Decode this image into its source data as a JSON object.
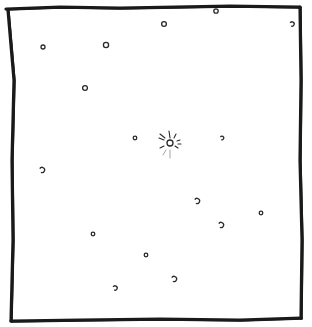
{
  "image": {
    "description": "Hand-drawn square frame containing scattered small circles with a central circle surrounded by radiating marks",
    "colors": {
      "background": "#ffffff",
      "ink": "#1a1a1a"
    }
  },
  "frame": {
    "top": [
      [
        6,
        9
      ],
      [
        60,
        7
      ],
      [
        120,
        8
      ],
      [
        175,
        7
      ],
      [
        230,
        6
      ],
      [
        300,
        7
      ]
    ],
    "right": [
      [
        300,
        7
      ],
      [
        301,
        80
      ],
      [
        300,
        160
      ],
      [
        302,
        240
      ],
      [
        301,
        318
      ]
    ],
    "bottom": [
      [
        301,
        318
      ],
      [
        240,
        320
      ],
      [
        160,
        319
      ],
      [
        80,
        320
      ],
      [
        11,
        321
      ]
    ],
    "left": [
      [
        11,
        321
      ],
      [
        13,
        240
      ],
      [
        12,
        160
      ],
      [
        14,
        80
      ],
      [
        8,
        10
      ]
    ]
  },
  "dots": [
    {
      "x": 43,
      "y": 47,
      "r": 2.0
    },
    {
      "x": 106,
      "y": 45,
      "r": 2.6
    },
    {
      "x": 164,
      "y": 24,
      "r": 2.4
    },
    {
      "x": 216,
      "y": 11,
      "r": 2.2
    },
    {
      "x": 292,
      "y": 24,
      "r": 2.2,
      "open": true
    },
    {
      "x": 85,
      "y": 88,
      "r": 2.4
    },
    {
      "x": 135,
      "y": 138,
      "r": 1.8
    },
    {
      "x": 222,
      "y": 138,
      "r": 1.8,
      "open": true
    },
    {
      "x": 42,
      "y": 170,
      "r": 2.6,
      "open": true
    },
    {
      "x": 197,
      "y": 201,
      "r": 2.6,
      "open": true
    },
    {
      "x": 261,
      "y": 213,
      "r": 1.8
    },
    {
      "x": 221,
      "y": 225,
      "r": 2.6,
      "open": true
    },
    {
      "x": 93,
      "y": 234,
      "r": 1.8
    },
    {
      "x": 146,
      "y": 255,
      "r": 1.8
    },
    {
      "x": 174,
      "y": 279,
      "r": 2.6,
      "open": true
    },
    {
      "x": 115,
      "y": 288,
      "r": 2.2,
      "open": true
    }
  ],
  "center_burst": {
    "x": 170,
    "y": 143,
    "r": 3.0,
    "rays": [
      [
        [
          169,
          131
        ],
        [
          170,
          138
        ]
      ],
      [
        [
          160,
          134
        ],
        [
          165,
          138
        ]
      ],
      [
        [
          159,
          138
        ],
        [
          164,
          140
        ]
      ],
      [
        [
          176,
          134
        ],
        [
          174,
          138
        ]
      ],
      [
        [
          180,
          140
        ],
        [
          177,
          141
        ]
      ],
      [
        [
          160,
          148
        ],
        [
          164,
          146
        ]
      ],
      [
        [
          178,
          148
        ],
        [
          175,
          146
        ]
      ],
      [
        [
          181,
          144
        ],
        [
          178,
          144
        ]
      ]
    ],
    "faint_rays": [
      [
        [
          170,
          150
        ],
        [
          170,
          158
        ]
      ],
      [
        [
          166,
          150
        ],
        [
          163,
          155
        ]
      ]
    ]
  }
}
